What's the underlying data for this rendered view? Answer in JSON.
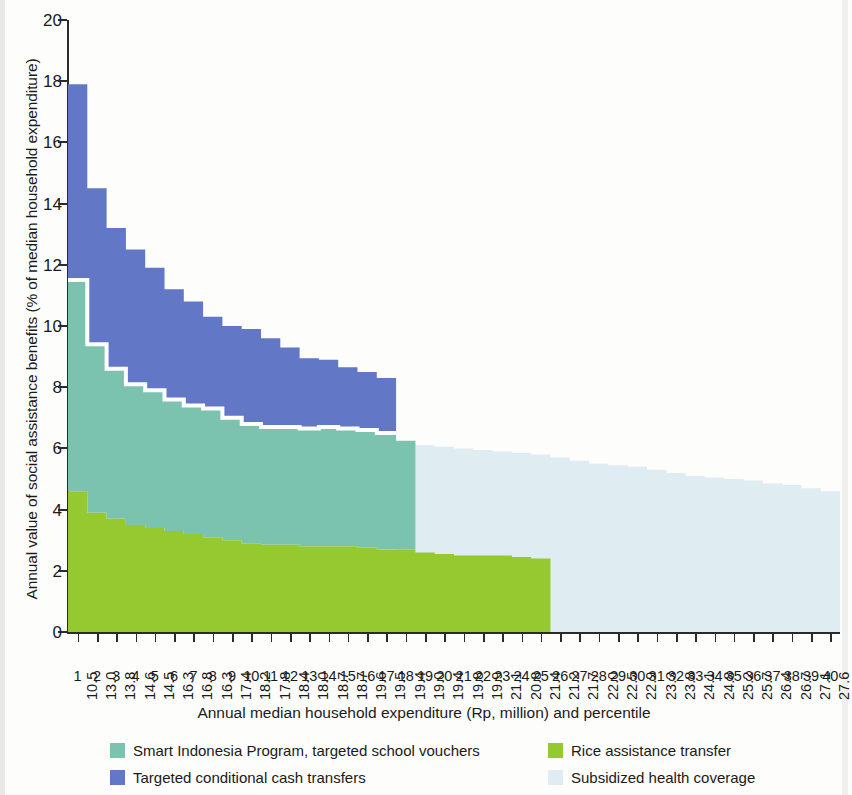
{
  "axes": {
    "y_title": "Annual value of social assistance benefits (% of median household expenditure)",
    "x_title": "Annual median household expenditure (Rp, million) and percentile",
    "y_ticks": [
      "0",
      "2",
      "4",
      "6",
      "8",
      "10",
      "12",
      "14",
      "16",
      "18",
      "20"
    ]
  },
  "legend": {
    "items": [
      {
        "label": "Smart Indonesia Program, targeted school vouchers",
        "color": "#7CC3AF"
      },
      {
        "label": "Targeted conditional cash transfers",
        "color": "#6277C6"
      },
      {
        "label": "Rice assistance transfer",
        "color": "#96C830"
      },
      {
        "label": "Subsidized health coverage",
        "color": "#DFECF2"
      }
    ]
  },
  "chart_data": {
    "type": "area",
    "title": "",
    "xlabel": "Annual median household expenditure (Rp, million) and percentile",
    "ylabel": "Annual value of social assistance benefits (% of median household expenditure)",
    "ylim": [
      0,
      20
    ],
    "ytick_step": 2,
    "grid": false,
    "stacked": true,
    "legend_position": "bottom",
    "percentiles": [
      1,
      2,
      3,
      4,
      5,
      6,
      7,
      8,
      9,
      10,
      11,
      12,
      13,
      14,
      15,
      16,
      17,
      18,
      19,
      20,
      21,
      22,
      23,
      24,
      25,
      26,
      27,
      28,
      29,
      30,
      31,
      32,
      33,
      34,
      35,
      36,
      37,
      38,
      39,
      40
    ],
    "expenditure": [
      "10.5",
      "13.0",
      "13.8",
      "14.6",
      "14.5",
      "16.3",
      "16.8",
      "16.3",
      "17.4",
      "18.2",
      "17.8",
      "18.4",
      "18.0",
      "18.7",
      "18.7",
      "19.6",
      "19.5",
      "19.4",
      "19.0",
      "19.4",
      "19.8",
      "19.9",
      "21.1",
      "20.8",
      "21.4",
      "21.2",
      "21.7",
      "22.0",
      "22.5",
      "22.9",
      "23.3",
      "23.8",
      "24.1",
      "24.8",
      "25.2",
      "25.7",
      "26.4",
      "26.7",
      "27.1",
      "27.6"
    ],
    "series": [
      {
        "name": "Rice assistance transfer",
        "color": "#96C830",
        "values": [
          4.6,
          3.9,
          3.7,
          3.5,
          3.4,
          3.3,
          3.2,
          3.1,
          3.0,
          2.9,
          2.85,
          2.85,
          2.8,
          2.8,
          2.8,
          2.75,
          2.7,
          2.7,
          2.6,
          2.55,
          2.5,
          2.5,
          2.5,
          2.45,
          2.4,
          0,
          0,
          0,
          0,
          0,
          0,
          0,
          0,
          0,
          0,
          0,
          0,
          0,
          0,
          0
        ]
      },
      {
        "name": "Smart Indonesia Program, targeted school vouchers",
        "color": "#7CC3AF",
        "values": [
          6.9,
          5.5,
          4.9,
          4.6,
          4.5,
          4.3,
          4.2,
          4.2,
          4.0,
          3.9,
          3.85,
          3.85,
          3.85,
          3.9,
          3.85,
          3.85,
          3.8,
          3.55,
          0,
          0,
          0,
          0,
          0,
          0,
          0,
          0,
          0,
          0,
          0,
          0,
          0,
          0,
          0,
          0,
          0,
          0,
          0,
          0,
          0,
          0
        ]
      },
      {
        "name": "Targeted conditional cash transfers",
        "color": "#6277C6",
        "values": [
          6.4,
          5.1,
          4.6,
          4.4,
          4.0,
          3.6,
          3.4,
          3.0,
          3.0,
          3.1,
          2.9,
          2.6,
          2.3,
          2.2,
          2.0,
          1.9,
          1.8,
          0,
          0,
          0,
          0,
          0,
          0,
          0,
          0,
          0,
          0,
          0,
          0,
          0,
          0,
          0,
          0,
          0,
          0,
          0,
          0,
          0,
          0,
          0
        ]
      },
      {
        "name": "Subsidized health coverage",
        "color": "#DFECF2",
        "values": [
          0,
          0,
          0,
          0,
          0,
          0,
          0,
          0,
          0,
          0,
          0,
          0,
          0,
          0,
          0,
          0,
          0,
          6.2,
          6.1,
          6.05,
          6.0,
          5.95,
          5.9,
          5.85,
          5.8,
          5.7,
          5.6,
          5.5,
          5.45,
          5.4,
          5.3,
          5.2,
          5.1,
          5.05,
          5.0,
          4.95,
          4.85,
          4.8,
          4.7,
          4.6
        ]
      }
    ],
    "stack_tops": {
      "rice": [
        4.6,
        3.9,
        3.7,
        3.5,
        3.4,
        3.3,
        3.2,
        3.1,
        3.0,
        2.9,
        2.85,
        2.85,
        2.8,
        2.8,
        2.8,
        2.75,
        2.7,
        2.7,
        2.6,
        2.55,
        2.5,
        2.5,
        2.5,
        2.45,
        2.4
      ],
      "smart": [
        11.5,
        9.4,
        8.6,
        8.1,
        7.9,
        7.6,
        7.4,
        7.3,
        7.0,
        6.8,
        6.7,
        6.7,
        6.65,
        6.7,
        6.65,
        6.6,
        6.5,
        6.25
      ],
      "cct": [
        17.9,
        14.5,
        13.2,
        12.5,
        11.9,
        11.2,
        10.8,
        10.3,
        10.0,
        9.9,
        9.6,
        9.3,
        8.95,
        8.9,
        8.65,
        8.5,
        8.3
      ],
      "health": [
        6.2,
        6.1,
        6.05,
        6.0,
        5.95,
        5.9,
        5.85,
        5.8,
        5.7,
        5.6,
        5.5,
        5.45,
        5.4,
        5.3,
        5.2,
        5.1,
        5.05,
        5.0,
        4.95,
        4.85,
        4.8,
        4.7,
        4.6
      ]
    }
  }
}
